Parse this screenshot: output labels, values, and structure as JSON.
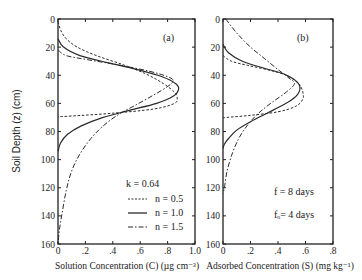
{
  "chart_data": [
    {
      "panel": "(a)",
      "type": "line",
      "orientation": "depth-profile (x = concentration, y = depth increasing downward)",
      "title": "",
      "xlabel": "Solution Concentration (C) (µg cm⁻³)",
      "ylabel": "Soil Depth (z) (cm)",
      "xlim": [
        0,
        1.0
      ],
      "ylim": [
        0,
        160
      ],
      "y_inverted": true,
      "xticks": [
        "0",
        ".2",
        ".4",
        ".6",
        ".8",
        "1.0"
      ],
      "yticks": [
        "0",
        "20",
        "40",
        "60",
        "80",
        "100",
        "120",
        "140",
        "160"
      ],
      "grid": false,
      "legend": {
        "title": "k = 0.64",
        "position": "lower right",
        "entries": [
          {
            "label": "n = 0.5",
            "style": "dashed"
          },
          {
            "label": "n = 1.0",
            "style": "solid"
          },
          {
            "label": "n = 1.5",
            "style": "dash-dot"
          }
        ]
      },
      "series": [
        {
          "name": "n = 0.5",
          "style": "dashed",
          "points": [
            [
              0.0,
              2
            ],
            [
              0.02,
              8
            ],
            [
              0.06,
              14
            ],
            [
              0.14,
              20
            ],
            [
              0.28,
              26
            ],
            [
              0.46,
              32
            ],
            [
              0.64,
              39
            ],
            [
              0.77,
              46
            ],
            [
              0.85,
              52
            ],
            [
              0.87,
              56
            ],
            [
              0.85,
              60
            ],
            [
              0.7,
              64
            ],
            [
              0.4,
              67
            ],
            [
              0.1,
              69
            ],
            [
              0.0,
              69.5
            ]
          ]
        },
        {
          "name": "n = 1.0",
          "style": "solid",
          "points": [
            [
              0.0,
              14
            ],
            [
              0.04,
              20
            ],
            [
              0.16,
              26
            ],
            [
              0.36,
              31
            ],
            [
              0.58,
              36
            ],
            [
              0.76,
              41
            ],
            [
              0.86,
              46
            ],
            [
              0.88,
              50
            ],
            [
              0.84,
              55
            ],
            [
              0.72,
              60
            ],
            [
              0.52,
              65
            ],
            [
              0.33,
              70
            ],
            [
              0.17,
              76
            ],
            [
              0.07,
              82
            ],
            [
              0.02,
              88
            ],
            [
              0.0,
              94
            ]
          ]
        },
        {
          "name": "n = 1.5",
          "style": "dash-dot",
          "points": [
            [
              0.0,
              22
            ],
            [
              0.06,
              26
            ],
            [
              0.22,
              29
            ],
            [
              0.46,
              33
            ],
            [
              0.66,
              37
            ],
            [
              0.8,
              41
            ],
            [
              0.84,
              44
            ],
            [
              0.8,
              48
            ],
            [
              0.7,
              54
            ],
            [
              0.57,
              61
            ],
            [
              0.44,
              68
            ],
            [
              0.33,
              76
            ],
            [
              0.24,
              85
            ],
            [
              0.16,
              96
            ],
            [
              0.1,
              108
            ],
            [
              0.06,
              122
            ],
            [
              0.03,
              138
            ],
            [
              0.01,
              150
            ],
            [
              0.0,
              160
            ]
          ]
        }
      ],
      "annotations": [
        "(a)"
      ]
    },
    {
      "panel": "(b)",
      "type": "line",
      "orientation": "depth-profile (x = concentration, y = depth increasing downward)",
      "title": "",
      "xlabel": "Adsorbed Concentration (S) (mg kg⁻¹)",
      "ylabel": "",
      "xlim": [
        0,
        0.8
      ],
      "ylim": [
        0,
        160
      ],
      "y_inverted": true,
      "xticks": [
        "0",
        ".2",
        ".4",
        ".6",
        ".8"
      ],
      "yticks": [
        "0",
        "20",
        "40",
        "60",
        "80",
        "100",
        "120",
        "140",
        "160"
      ],
      "grid": false,
      "annotations": [
        "(b)",
        "f = 8 days",
        "fₒ = 4 days"
      ],
      "series": [
        {
          "name": "n = 0.5",
          "style": "dashed",
          "points": [
            [
              0.0,
              26
            ],
            [
              0.06,
              30
            ],
            [
              0.18,
              33
            ],
            [
              0.32,
              36
            ],
            [
              0.46,
              40
            ],
            [
              0.55,
              46
            ],
            [
              0.58,
              52
            ],
            [
              0.58,
              57
            ],
            [
              0.53,
              62
            ],
            [
              0.4,
              66
            ],
            [
              0.2,
              68.5
            ],
            [
              0.03,
              70
            ],
            [
              0.0,
              70.2
            ]
          ]
        },
        {
          "name": "n = 1.0",
          "style": "solid",
          "points": [
            [
              0.0,
              18
            ],
            [
              0.04,
              24
            ],
            [
              0.14,
              30
            ],
            [
              0.3,
              35
            ],
            [
              0.44,
              39
            ],
            [
              0.53,
              44
            ],
            [
              0.56,
              49
            ],
            [
              0.53,
              55
            ],
            [
              0.44,
              61
            ],
            [
              0.32,
              67
            ],
            [
              0.2,
              73
            ],
            [
              0.1,
              79
            ],
            [
              0.04,
              85
            ],
            [
              0.01,
              89
            ],
            [
              0.0,
              92
            ]
          ]
        },
        {
          "name": "n = 1.5",
          "style": "dash-dot",
          "points": [
            [
              0.02,
              0
            ],
            [
              0.1,
              10
            ],
            [
              0.2,
              20
            ],
            [
              0.3,
              28
            ],
            [
              0.4,
              36
            ],
            [
              0.48,
              42
            ],
            [
              0.52,
              46
            ],
            [
              0.46,
              52
            ],
            [
              0.36,
              59
            ],
            [
              0.27,
              66
            ],
            [
              0.19,
              74
            ],
            [
              0.12,
              84
            ],
            [
              0.07,
              95
            ],
            [
              0.03,
              108
            ],
            [
              0.01,
              120
            ],
            [
              0.0,
              124
            ]
          ]
        }
      ]
    }
  ],
  "figure": {
    "panel_a_label": "(a)",
    "panel_b_label": "(b)",
    "ylabel": "Soil Depth (z) (cm)",
    "xlabel_a": "Solution Concentration (C) (µg cm⁻³)",
    "xlabel_b": "Adsorbed Concentration (S) (mg kg⁻¹)",
    "legend_title": "k = 0.64",
    "legend": [
      "n = 0.5",
      "n = 1.0",
      "n = 1.5"
    ],
    "note_f": "f  = 8 days",
    "note_f0": "fₒ= 4 days",
    "line_color": "#2a2a2a",
    "frame_color": "#222222"
  }
}
